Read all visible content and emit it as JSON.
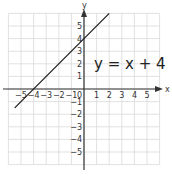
{
  "chart_data": {
    "type": "line",
    "title": "",
    "equation": "y = x + 4",
    "xlabel": "x",
    "ylabel": "y",
    "xlim": [
      -6,
      6
    ],
    "ylim": [
      -6,
      6
    ],
    "grid": true,
    "x_tick_labels": [
      "-5",
      "-4",
      "-3",
      "-2",
      "-1",
      "0",
      "1",
      "2",
      "3",
      "4",
      "5"
    ],
    "y_tick_labels": [
      "5",
      "4",
      "3",
      "2",
      "1",
      "-1",
      "-2",
      "-3",
      "-4",
      "-5"
    ],
    "series": [
      {
        "name": "y = x + 4",
        "slope": 1,
        "intercept": 4,
        "x": [
          -5.5,
          2
        ],
        "y": [
          -1.5,
          6
        ]
      }
    ],
    "x_intercept": -4,
    "y_intercept": 4
  },
  "labels": {
    "x_axis": "x",
    "y_axis": "y",
    "equation": "y = x + 4"
  },
  "colors": {
    "grid": "#d9d9d9",
    "axis": "#333333",
    "line": "#222222"
  }
}
